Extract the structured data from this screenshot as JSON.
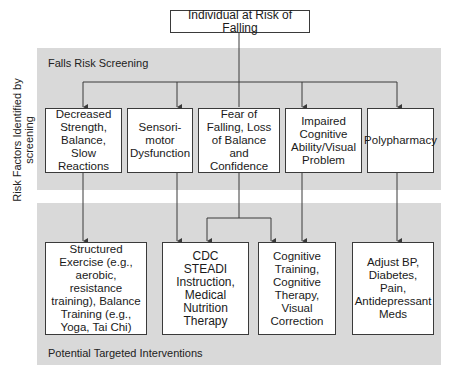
{
  "root": {
    "label": "Individual at Risk of Falling"
  },
  "side_label": "Risk Factors Identified by screening",
  "screening_band": {
    "label": "Falls Risk Screening"
  },
  "interventions_band": {
    "label": "Potential Targeted Interventions"
  },
  "risk_factors": [
    {
      "label": "Decreased Strength, Balance, Slow Reactions"
    },
    {
      "label": "Sensori-motor Dysfunction"
    },
    {
      "label": "Fear of Falling, Loss of Balance and Confidence"
    },
    {
      "label": "Impaired Cognitive Ability/Visual Problem"
    },
    {
      "label": "Polypharmacy"
    }
  ],
  "interventions": [
    {
      "label": "Structured Exercise (e.g., aerobic, resistance training), Balance Training (e.g., Yoga, Tai Chi)"
    },
    {
      "label": "CDC STEADI Instruction, Medical Nutrition Therapy"
    },
    {
      "label": "Cognitive Training, Cognitive Therapy, Visual Correction"
    },
    {
      "label": "Adjust BP, Diabetes, Pain, Antidepressant Meds"
    }
  ],
  "colors": {
    "band": "#d9d9d9",
    "line": "#3a3a3a",
    "box": "#ffffff"
  }
}
